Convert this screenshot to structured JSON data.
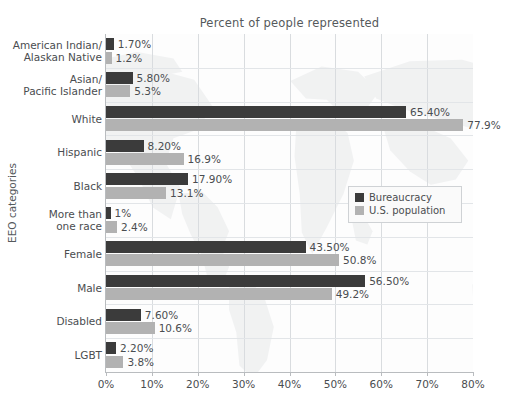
{
  "chart_data": {
    "type": "bar",
    "orientation": "horizontal",
    "title": "Percent of people represented",
    "xlabel": "",
    "ylabel": "EEO categories",
    "xlim": [
      0,
      80
    ],
    "xtick_labels": [
      "0%",
      "10%",
      "20%",
      "30%",
      "40%",
      "50%",
      "60%",
      "70%",
      "80%"
    ],
    "xticks": [
      0,
      10,
      20,
      30,
      40,
      50,
      60,
      70,
      80
    ],
    "grid": "vertical",
    "legend_position": "center-right",
    "categories": [
      "American Indian/\nAlaskan Native",
      "Asian/\nPacific Islander",
      "White",
      "Hispanic",
      "Black",
      "More than\none race",
      "Female",
      "Male",
      "Disabled",
      "LGBT"
    ],
    "series": [
      {
        "name": "Bureaucracy",
        "color": "#3b3b3b",
        "values": [
          1.7,
          5.8,
          65.4,
          8.2,
          17.9,
          1.0,
          43.5,
          56.5,
          7.6,
          2.2
        ],
        "labels": [
          "1.70%",
          "5.80%",
          "65.40%",
          "8.20%",
          "17.90%",
          "1%",
          "43.50%",
          "56.50%",
          "7.60%",
          "2.20%"
        ]
      },
      {
        "name": "U.S. population",
        "color": "#b2b2b2",
        "values": [
          1.2,
          5.3,
          77.9,
          16.9,
          13.1,
          2.4,
          50.8,
          49.2,
          10.6,
          3.8
        ],
        "labels": [
          "1.2%",
          "5.3%",
          "77.9%",
          "16.9%",
          "13.1%",
          "2.4%",
          "50.8%",
          "49.2%",
          "10.6%",
          "3.8%"
        ]
      }
    ]
  },
  "legend": {
    "items": [
      {
        "label": "Bureaucracy",
        "color": "#3b3b3b"
      },
      {
        "label": "U.S. population",
        "color": "#b2b2b2"
      }
    ]
  },
  "colors": {
    "series_bureaucracy": "#3b3b3b",
    "series_population": "#b2b2b2",
    "gridline": "#d9dcdf",
    "axis": "#b9bcbf",
    "text": "#4a4d50",
    "background": "#ffffff"
  }
}
